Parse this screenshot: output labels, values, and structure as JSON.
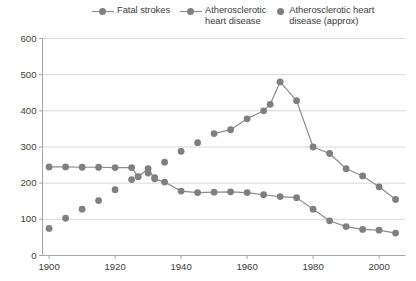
{
  "legend": {
    "items": [
      {
        "label": "Fatal strokes",
        "marker": "line-dot",
        "color": "#7f7f7f"
      },
      {
        "label": "Atherosclerotic\nheart disease",
        "marker": "line-dot",
        "color": "#7f7f7f"
      },
      {
        "label": "Atherosclerotic heart\ndisease (approx)",
        "marker": "dot",
        "color": "#7f7f7f"
      }
    ]
  },
  "axes": {
    "y_ticks": [
      "0",
      "100",
      "200",
      "300",
      "400",
      "500",
      "600"
    ],
    "x_ticks": [
      "1900",
      "1920",
      "1940",
      "1960",
      "1980",
      "2000"
    ]
  },
  "chart_data": {
    "type": "line",
    "title": "",
    "xlabel": "",
    "ylabel": "",
    "xlim": [
      1898,
      2008
    ],
    "ylim": [
      0,
      600
    ],
    "grid": true,
    "legend_position": "top",
    "series": [
      {
        "name": "Fatal strokes",
        "marker": "circle",
        "line": true,
        "color": "#7f7f7f",
        "points": [
          [
            1900,
            245
          ],
          [
            1905,
            245
          ],
          [
            1910,
            244
          ],
          [
            1915,
            244
          ],
          [
            1920,
            243
          ],
          [
            1925,
            243
          ],
          [
            1927,
            218
          ],
          [
            1930,
            240
          ],
          [
            1932,
            212
          ],
          [
            1935,
            203
          ],
          [
            1940,
            178
          ],
          [
            1945,
            174
          ],
          [
            1950,
            175
          ],
          [
            1955,
            176
          ],
          [
            1960,
            174
          ],
          [
            1965,
            168
          ],
          [
            1970,
            163
          ],
          [
            1975,
            160
          ],
          [
            1980,
            128
          ],
          [
            1985,
            96
          ],
          [
            1990,
            80
          ],
          [
            1995,
            72
          ],
          [
            2000,
            70
          ],
          [
            2005,
            62
          ]
        ]
      },
      {
        "name": "Atherosclerotic heart disease",
        "marker": "circle",
        "line": true,
        "color": "#7f7f7f",
        "points": [
          [
            1950,
            337
          ],
          [
            1955,
            348
          ],
          [
            1960,
            378
          ],
          [
            1965,
            400
          ],
          [
            1967,
            418
          ],
          [
            1970,
            480
          ],
          [
            1975,
            428
          ],
          [
            1980,
            300
          ],
          [
            1985,
            282
          ],
          [
            1990,
            240
          ],
          [
            1995,
            220
          ],
          [
            2000,
            190
          ],
          [
            2005,
            155
          ]
        ]
      },
      {
        "name": "Atherosclerotic heart disease (approx)",
        "marker": "circle",
        "line": false,
        "color": "#7f7f7f",
        "points": [
          [
            1900,
            75
          ],
          [
            1905,
            103
          ],
          [
            1910,
            128
          ],
          [
            1915,
            152
          ],
          [
            1920,
            182
          ],
          [
            1925,
            210
          ],
          [
            1930,
            228
          ],
          [
            1932,
            215
          ],
          [
            1935,
            258
          ],
          [
            1940,
            288
          ],
          [
            1945,
            312
          ]
        ]
      }
    ]
  },
  "style": {
    "gridline_color": "#d9d9d9",
    "axis_color": "#a6a6a6",
    "series_color": "#7f7f7f",
    "line_color": "#8c8c8c",
    "background": "#ffffff"
  }
}
